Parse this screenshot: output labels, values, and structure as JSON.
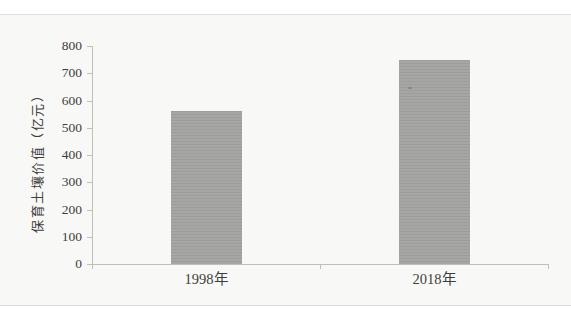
{
  "figure": {
    "page_background": "#ffffff",
    "panel_background": "#f8f8f6",
    "panel_edge_color": "#dedeD9",
    "axis_color": "#bfbfbc",
    "text_color": "#3e3e3c"
  },
  "chart_data": {
    "type": "bar",
    "title": "",
    "categories": [
      "1998年",
      "2018年"
    ],
    "values": [
      560,
      750
    ],
    "xlabel": "",
    "ylabel": "保育土壤价值（亿元）",
    "ylim": [
      0,
      800
    ],
    "yticks": [
      0,
      100,
      200,
      300,
      400,
      500,
      600,
      700,
      800
    ],
    "grid": false,
    "legend": "none",
    "bar_color": "#a3a3a1"
  }
}
